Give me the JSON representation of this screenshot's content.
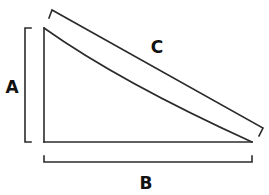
{
  "diagram": {
    "labels": {
      "a": "A",
      "b": "B",
      "c": "C"
    },
    "colors": {
      "stroke": "#2b2b2b",
      "text": "#111111",
      "background": "#ffffff"
    },
    "shapes": {
      "triangle": {
        "top_left": [
          44,
          28
        ],
        "bottom_left": [
          44,
          142
        ],
        "bottom_right": [
          252,
          142
        ],
        "hypotenuse": "slightly concave curve"
      },
      "bracket_a": {
        "orientation": "vertical",
        "x": 25,
        "y_range": [
          28,
          142
        ]
      },
      "bracket_b": {
        "orientation": "horizontal",
        "y": 162,
        "x_range": [
          44,
          252
        ]
      },
      "bracket_c": {
        "orientation": "diagonal",
        "from": [
          50,
          18
        ],
        "to": [
          262,
          128
        ]
      }
    }
  }
}
